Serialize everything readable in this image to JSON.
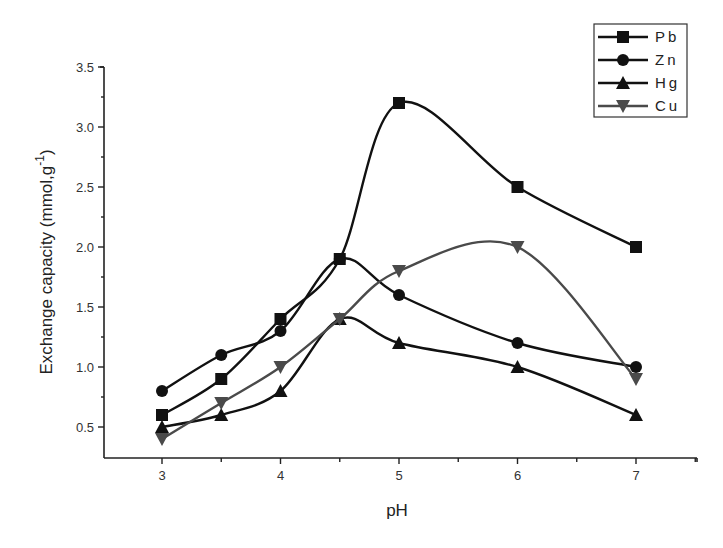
{
  "chart_data": {
    "type": "line",
    "title": "",
    "xlabel": "pH",
    "ylabel": "Exchange capacity (mmol,g",
    "ylabel_superscript": "-1",
    "ylabel_suffix": ")",
    "x": [
      3,
      3.5,
      4,
      4.5,
      5,
      6,
      7
    ],
    "xlim": [
      2.65,
      7.5
    ],
    "ylim": [
      0.24,
      3.5
    ],
    "x_ticks": [
      "3",
      "4",
      "5",
      "6",
      "7"
    ],
    "y_ticks": [
      "0.5",
      "1.0",
      "1.5",
      "2.0",
      "2.5",
      "3.0",
      "3.5"
    ],
    "grid": false,
    "legend_position": "top-right",
    "series": [
      {
        "name": "Pb",
        "marker": "square",
        "color": "#111111",
        "values": [
          0.6,
          0.9,
          1.4,
          1.9,
          3.2,
          2.5,
          2.0
        ]
      },
      {
        "name": "Zn",
        "marker": "circle",
        "color": "#111111",
        "values": [
          0.8,
          1.1,
          1.3,
          1.9,
          1.6,
          1.2,
          1.0
        ]
      },
      {
        "name": "Hg",
        "marker": "triangle-up",
        "color": "#111111",
        "values": [
          0.5,
          0.6,
          0.8,
          1.4,
          1.2,
          1.0,
          0.6
        ]
      },
      {
        "name": "Cu",
        "marker": "triangle-down",
        "color": "#4a4a4a",
        "values": [
          0.4,
          0.7,
          1.0,
          1.4,
          1.8,
          2.0,
          0.9
        ]
      }
    ]
  }
}
